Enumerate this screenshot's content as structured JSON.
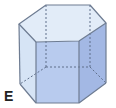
{
  "figure": {
    "shape": "hexagonal prism",
    "label": "E",
    "colors": {
      "top_face": "#e2ecf8",
      "left_face": "#d6e4f5",
      "front_face": "#b8cbee",
      "right_face": "#a3b8e4",
      "edge": "#6e7c92",
      "hidden_edge": "#5f6f8a"
    },
    "vertices": {
      "top": [
        [
          46,
          5
        ],
        [
          90,
          5
        ],
        [
          106,
          23
        ],
        [
          79,
          41
        ],
        [
          36,
          42
        ],
        [
          19,
          24
        ]
      ],
      "bottom": [
        [
          46,
          67
        ],
        [
          90,
          67
        ],
        [
          106,
          83
        ],
        [
          79,
          103
        ],
        [
          36,
          103
        ],
        [
          20,
          84
        ]
      ]
    }
  }
}
